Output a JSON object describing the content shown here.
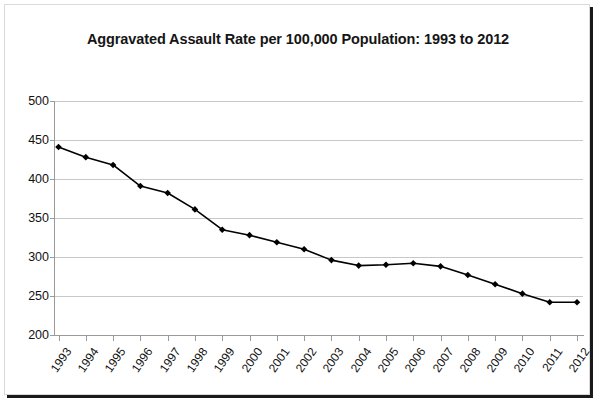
{
  "chart_data": {
    "type": "line",
    "title": "Aggravated Assault Rate per 100,000 Population: 1993 to 2012",
    "xlabel": "",
    "ylabel": "",
    "categories": [
      "1993",
      "1994",
      "1995",
      "1996",
      "1997",
      "1998",
      "1999",
      "2000",
      "2001",
      "2002",
      "2003",
      "2004",
      "2005",
      "2006",
      "2007",
      "2008",
      "2009",
      "2010",
      "2011",
      "2012"
    ],
    "values": [
      441,
      428,
      418,
      391,
      382,
      361,
      335,
      328,
      319,
      310,
      296,
      289,
      290,
      292,
      288,
      277,
      265,
      253,
      242,
      242
    ],
    "series": [
      {
        "name": "Aggravated Assault Rate",
        "values": [
          441,
          428,
          418,
          391,
          382,
          361,
          335,
          328,
          319,
          310,
          296,
          289,
          290,
          292,
          288,
          277,
          265,
          253,
          242,
          242
        ]
      }
    ],
    "ylim": [
      200,
      500
    ],
    "yticks": [
      200,
      250,
      300,
      350,
      400,
      450,
      500
    ],
    "ytick_labels": [
      "200",
      "250",
      "300",
      "350",
      "400",
      "450",
      "500"
    ],
    "grid": true,
    "legend": false,
    "marker": "diamond",
    "line_color": "#000000",
    "marker_color": "#000000",
    "grid_color": "#c8c8c8",
    "background_color": "#ffffff"
  }
}
